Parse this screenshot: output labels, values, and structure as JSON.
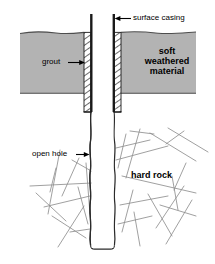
{
  "diagram": {
    "labels": {
      "surface_casing": "surface casing",
      "grout": "grout",
      "soft_weathered_material": "soft\nweathered\nmaterial",
      "soft_weathered_line1": "soft",
      "soft_weathered_line2": "weathered",
      "soft_weathered_line3": "material",
      "open_hole": "open hole",
      "hard_rock": "hard rock"
    },
    "colors": {
      "background": "#ffffff",
      "soft_material_fill": "#b3b3b3",
      "soft_material_edge": "#555555",
      "casing_line": "#1a1a1a",
      "grout_hatch": "#1a1a1a",
      "grout_fill": "#ffffff",
      "borehole_wall": "#2b2b2b",
      "fracture_line": "#8c8c8c",
      "label_text": "#000000",
      "arrow": "#000000"
    },
    "geometry": {
      "canvas_width": 215,
      "canvas_height": 264,
      "casing_top_y": 14,
      "ground_surface_y": 32,
      "soft_material_bottom_y": 93,
      "grout_bottom_y": 112,
      "borehole_bottom_y": 249,
      "hole_left_x": 91,
      "hole_right_x": 114,
      "grout_left_outer_x": 84,
      "grout_right_outer_x": 121
    },
    "elements": [
      {
        "name": "surface-casing",
        "kind": "pipe"
      },
      {
        "name": "grout-annulus",
        "kind": "hatched-band"
      },
      {
        "name": "soft-weathered-material",
        "kind": "fill-region"
      },
      {
        "name": "open-hole",
        "kind": "borehole"
      },
      {
        "name": "hard-rock",
        "kind": "fracture-network"
      }
    ]
  }
}
